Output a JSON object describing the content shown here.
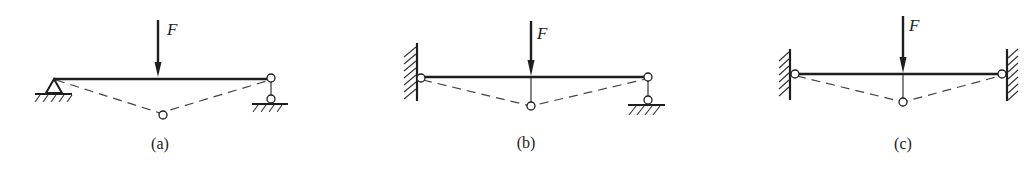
{
  "figure": {
    "colors": {
      "line": "#1e1e1e",
      "background": "#ffffff"
    },
    "panels": [
      {
        "id": "a",
        "caption": "(a)",
        "load_label": "F",
        "left_support": "pin-support",
        "right_support": "roller-link-support"
      },
      {
        "id": "b",
        "caption": "(b)",
        "load_label": "F",
        "left_support": "wall-hinge",
        "right_support": "roller-link-support"
      },
      {
        "id": "c",
        "caption": "(c)",
        "load_label": "F",
        "left_support": "wall-hinge",
        "right_support": "wall-hinge"
      }
    ]
  }
}
